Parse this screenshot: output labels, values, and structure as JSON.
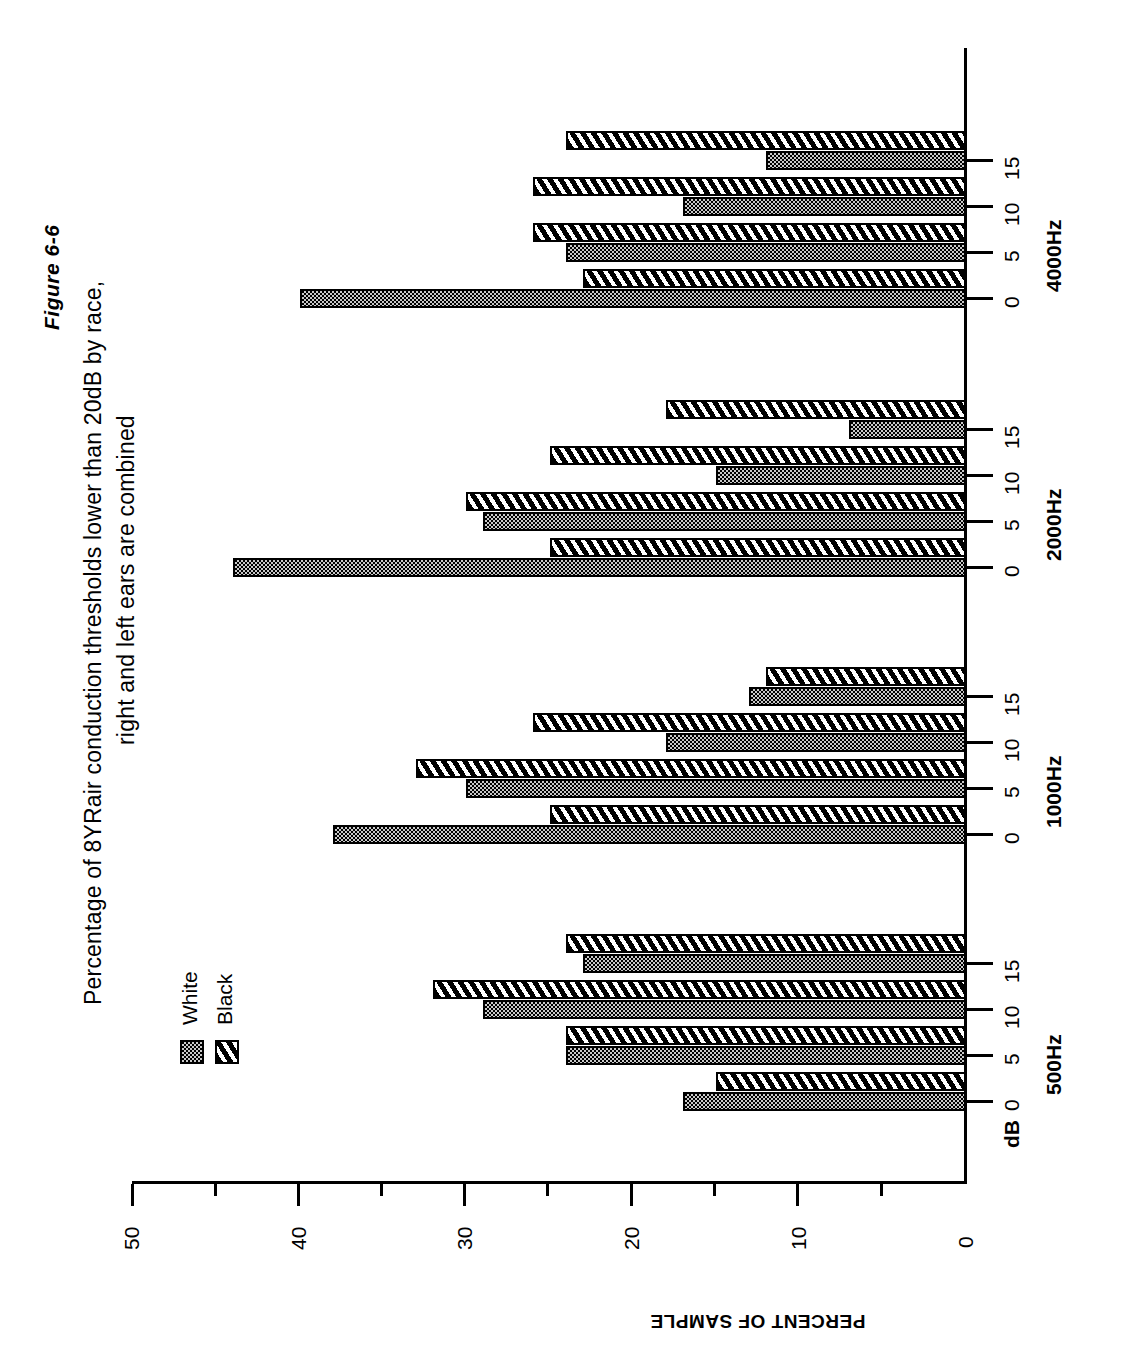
{
  "figure": {
    "label": "Figure 6-6",
    "title_line1": "Percentage of 8YRair conduction thresholds lower than 20dB by race,",
    "title_line2": "right and left ears are combined"
  },
  "legend": {
    "position": "left-middle",
    "items": [
      {
        "label": "White",
        "pattern": "stipple-dots",
        "color": "#c9c9c9"
      },
      {
        "label": "Black",
        "pattern": "diagonal-hatch",
        "color": "#000000"
      }
    ]
  },
  "axes": {
    "value_axis_title": "PERCENT OF SAMPLE",
    "value_ticks": [
      "50",
      "40",
      "30",
      "20",
      "10",
      "0"
    ],
    "value_minor_step": 5,
    "category_axis_unit_label": "dB",
    "category_levels": [
      "0",
      "5",
      "10",
      "15"
    ],
    "groups": [
      "500Hz",
      "1000Hz",
      "2000Hz",
      "4000Hz"
    ]
  },
  "chart_data": {
    "type": "bar",
    "orientation": "horizontal",
    "title": "Percentage of 8YRair conduction thresholds lower than 20dB by race, right and left ears are combined",
    "subtitle": "Figure 6-6",
    "xlabel": "dB",
    "ylabel": "PERCENT OF SAMPLE",
    "ylim": [
      0,
      50
    ],
    "yticks": [
      0,
      10,
      20,
      30,
      40,
      50
    ],
    "grid": false,
    "legend_position": "left",
    "categories": [
      "500Hz 0",
      "500Hz 5",
      "500Hz 10",
      "500Hz 15",
      "1000Hz 0",
      "1000Hz 5",
      "1000Hz 10",
      "1000Hz 15",
      "2000Hz 0",
      "2000Hz 5",
      "2000Hz 10",
      "2000Hz 15",
      "4000Hz 0",
      "4000Hz 5",
      "4000Hz 10",
      "4000Hz 15"
    ],
    "series": [
      {
        "name": "White",
        "values": [
          17,
          24,
          29,
          23,
          38,
          30,
          18,
          13,
          44,
          29,
          15,
          7,
          40,
          24,
          17,
          12
        ]
      },
      {
        "name": "Black",
        "values": [
          15,
          24,
          32,
          24,
          25,
          33,
          26,
          12,
          25,
          30,
          25,
          18,
          23,
          26,
          26,
          24
        ]
      }
    ],
    "groups": [
      {
        "frequency": "500Hz",
        "levels": [
          "0",
          "5",
          "10",
          "15"
        ],
        "White": [
          17,
          24,
          29,
          23
        ],
        "Black": [
          15,
          24,
          32,
          24
        ]
      },
      {
        "frequency": "1000Hz",
        "levels": [
          "0",
          "5",
          "10",
          "15"
        ],
        "White": [
          38,
          30,
          18,
          13
        ],
        "Black": [
          25,
          33,
          26,
          12
        ]
      },
      {
        "frequency": "2000Hz",
        "levels": [
          "0",
          "5",
          "10",
          "15"
        ],
        "White": [
          44,
          29,
          15,
          7
        ],
        "Black": [
          25,
          30,
          25,
          18
        ]
      },
      {
        "frequency": "4000Hz",
        "levels": [
          "0",
          "5",
          "10",
          "15"
        ],
        "White": [
          40,
          24,
          17,
          12
        ],
        "Black": [
          23,
          26,
          26,
          24
        ]
      }
    ]
  }
}
